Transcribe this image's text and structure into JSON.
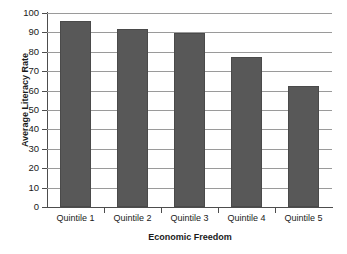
{
  "chart_data": {
    "type": "bar",
    "title": "",
    "subtitle": "",
    "xlabel": "Economic Freedom",
    "ylabel": "Average Literacy Rate",
    "categories": [
      "Quintile 1",
      "Quintile 2",
      "Quintile 3",
      "Quintile 4",
      "Quintile 5"
    ],
    "values": [
      96,
      92,
      89.5,
      77.5,
      62.5
    ],
    "ylim": [
      0,
      100
    ],
    "y_ticks": [
      0,
      10,
      20,
      30,
      40,
      50,
      60,
      70,
      80,
      90,
      100
    ],
    "y_tick_labels": [
      "0",
      "10",
      "20",
      "30",
      "40",
      "50",
      "60",
      "70",
      "80",
      "90",
      "100"
    ],
    "grid": true,
    "grid_axis": "y",
    "legend": false,
    "legend_position": "none",
    "bar_color": "#585858",
    "grid_color": "#9a9a9a",
    "axis_color": "#4d4d4d",
    "background_color": "#ffffff",
    "text_color": "#1a1a1a"
  }
}
